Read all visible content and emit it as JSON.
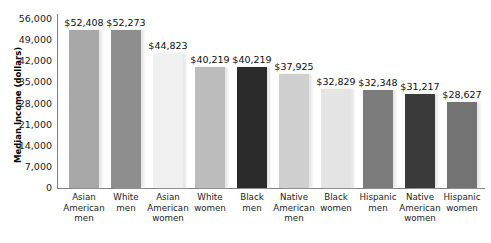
{
  "chart_data": {
    "type": "bar",
    "title": "",
    "xlabel": "",
    "ylabel": "Median Income (dollars)",
    "ylim": [
      0,
      56000
    ],
    "yticks": [
      "56,000",
      "49,000",
      "42,000",
      "35,000",
      "28,000",
      "21,000",
      "14,000",
      "7,000",
      "0"
    ],
    "ytick_values": [
      56000,
      49000,
      42000,
      35000,
      28000,
      21000,
      14000,
      7000,
      0
    ],
    "grid": false,
    "legend": "none",
    "categories": [
      "Asian American men",
      "White men",
      "Asian American women",
      "White women",
      "Black men",
      "Native American men",
      "Black women",
      "Hispanic men",
      "Native American women",
      "Hispanic women"
    ],
    "category_lines": [
      [
        "Asian",
        "American",
        "men"
      ],
      [
        "White",
        "men"
      ],
      [
        "Asian",
        "American",
        "women"
      ],
      [
        "White",
        "women"
      ],
      [
        "Black",
        "men"
      ],
      [
        "Native",
        "American",
        "men"
      ],
      [
        "Black",
        "women"
      ],
      [
        "Hispanic",
        "men"
      ],
      [
        "Native",
        "American",
        "women"
      ],
      [
        "Hispanic",
        "women"
      ]
    ],
    "values": [
      52408,
      52273,
      44823,
      40219,
      40219,
      37925,
      32829,
      32348,
      31217,
      28627
    ],
    "value_labels": [
      "$52,408",
      "$52,273",
      "$44,823",
      "$40,219",
      "$40,219",
      "$37,925",
      "$32,829",
      "$32,348",
      "$31,217",
      "$28,627"
    ],
    "bar_colors": [
      "#a8a8a8",
      "#8e8e8e",
      "#f0f0f0",
      "#bcbcbc",
      "#2b2b2b",
      "#cfcfcf",
      "#e4e4e4",
      "#7c7c7c",
      "#3a3a3a",
      "#737373"
    ],
    "axis_color": "#808080",
    "text_color": "#1a1a1a"
  }
}
